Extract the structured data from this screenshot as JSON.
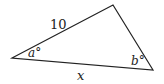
{
  "diagram": {
    "type": "triangle",
    "side_label_top_left": "10",
    "side_label_bottom": "x",
    "angle_left": "a°",
    "angle_right": "b°",
    "stroke_color": "#222222",
    "vertices": {
      "left": [
        12,
        58
      ],
      "top": [
        113,
        5
      ],
      "bottom_right": [
        153,
        70
      ]
    }
  }
}
